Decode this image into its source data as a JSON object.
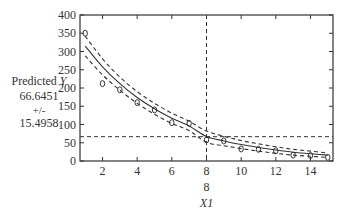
{
  "prediction_panel": {
    "label": "Predicted",
    "label_var": "Y",
    "value": "66.6451",
    "plus_minus": "+/-",
    "half_width": "15.4958"
  },
  "x_current": "8",
  "chart_data": {
    "type": "scatter",
    "title": "",
    "xlabel": "X1",
    "ylabel": "Predicted Y",
    "xlim": [
      0.7,
      15.3
    ],
    "ylim": [
      0,
      400
    ],
    "x_ticks": [
      2,
      4,
      6,
      8,
      10,
      12,
      14
    ],
    "y_ticks": [
      0,
      50,
      100,
      150,
      200,
      250,
      300,
      350,
      400
    ],
    "grid": false,
    "series": [
      {
        "name": "observations",
        "style": "markers",
        "x": [
          1,
          2,
          3,
          4,
          5,
          6,
          7,
          8,
          9,
          10,
          11,
          12,
          13,
          14,
          15
        ],
        "y": [
          350,
          212,
          195,
          160,
          140,
          105,
          103,
          58,
          55,
          33,
          32,
          28,
          16,
          15,
          10
        ]
      },
      {
        "name": "fit",
        "style": "solid",
        "x": [
          1,
          2,
          3,
          4,
          5,
          6,
          7,
          8,
          9,
          10,
          11,
          12,
          13,
          14,
          15
        ],
        "y": [
          315,
          258,
          212,
          174,
          143,
          117,
          96,
          67,
          55,
          45,
          37,
          30,
          24,
          20,
          16
        ]
      },
      {
        "name": "upper confidence bound",
        "style": "dashed",
        "x": [
          1,
          2,
          3,
          4,
          5,
          6,
          7,
          8,
          9,
          10,
          11,
          12,
          13,
          14,
          15
        ],
        "y": [
          342,
          280,
          230,
          190,
          158,
          131,
          109,
          82,
          68,
          56,
          47,
          39,
          32,
          27,
          22
        ]
      },
      {
        "name": "lower confidence bound",
        "style": "dashed",
        "x": [
          1,
          2,
          3,
          4,
          5,
          6,
          7,
          8,
          9,
          10,
          11,
          12,
          13,
          14,
          15
        ],
        "y": [
          288,
          236,
          194,
          158,
          128,
          103,
          83,
          51,
          42,
          34,
          27,
          21,
          16,
          13,
          10
        ]
      }
    ],
    "annotations": [
      {
        "type": "vline",
        "x": 8,
        "style": "dashed"
      },
      {
        "type": "hline",
        "y": 66.6451,
        "style": "dashed"
      }
    ]
  }
}
